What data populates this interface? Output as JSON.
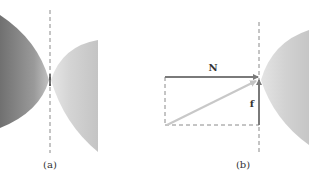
{
  "panels": [
    {
      "id": "a",
      "caption": "(a)",
      "description": "Two curved bodies touching at a single point on a dashed vertical line"
    },
    {
      "id": "b",
      "caption": "(b)",
      "description": "Contact force at the contact point decomposed into normal and friction components",
      "vectors": {
        "normal": "N",
        "friction": "f"
      }
    }
  ],
  "colors": {
    "dark_body": "#7d7d7d",
    "dark_body_light": "#b0b0b0",
    "light_body": "#c8c8c8",
    "light_body_edge": "#e2e2e2",
    "vector": "#7a7a7a",
    "resultant": "#c4c4c4",
    "dashed_line": "#8a8a8a"
  }
}
